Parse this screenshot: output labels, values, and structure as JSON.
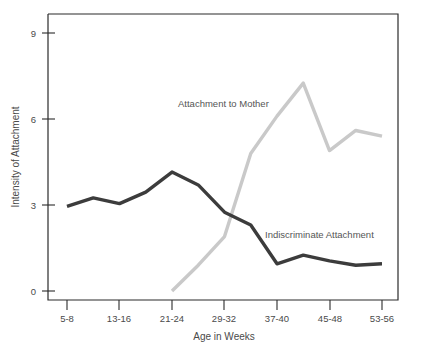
{
  "chart_data": {
    "type": "line",
    "title": "",
    "xlabel": "Age in Weeks",
    "ylabel": "Intensity of Attachment",
    "categories": [
      "5-8",
      "9-12",
      "13-16",
      "17-20",
      "21-24",
      "25-28",
      "29-32",
      "33-36",
      "37-40",
      "41-44",
      "45-48",
      "49-52",
      "53-56"
    ],
    "tick_labels_x": [
      "5-8",
      "13-16",
      "21-24",
      "29-32",
      "37-40",
      "45-48",
      "53-56"
    ],
    "tick_labels_y": [
      "0",
      "3",
      "6",
      "9"
    ],
    "ylim": [
      0,
      9.6
    ],
    "yticks": [
      0,
      3,
      6,
      9
    ],
    "grid": false,
    "legend_position": "inline-annotations",
    "series": [
      {
        "name": "Indiscriminate Attachment",
        "color": "#3c3c3c",
        "label_text": "Indiscriminate Attachment",
        "x": [
          "5-8",
          "9-12",
          "13-16",
          "17-20",
          "21-24",
          "25-28",
          "29-32",
          "33-36",
          "37-40",
          "41-44",
          "45-48",
          "49-52",
          "53-56"
        ],
        "values": [
          2.95,
          3.25,
          3.05,
          3.45,
          4.15,
          3.7,
          2.75,
          2.3,
          0.95,
          1.25,
          1.05,
          0.9,
          0.95
        ]
      },
      {
        "name": "Attachment to Mother",
        "color": "#c9c9c9",
        "label_text": "Attachment to Mother",
        "x": [
          "21-24",
          "25-28",
          "29-32",
          "33-36",
          "37-40",
          "41-44",
          "45-48",
          "49-52",
          "53-56"
        ],
        "values": [
          0.0,
          0.9,
          1.9,
          4.8,
          6.1,
          7.25,
          4.9,
          5.6,
          5.4
        ]
      }
    ],
    "annotations": [
      {
        "text": "Attachment to Mother",
        "x_px": 178,
        "y_px": 107
      },
      {
        "text": "Indiscriminate Attachment",
        "x_px": 265,
        "y_px": 238
      }
    ]
  }
}
